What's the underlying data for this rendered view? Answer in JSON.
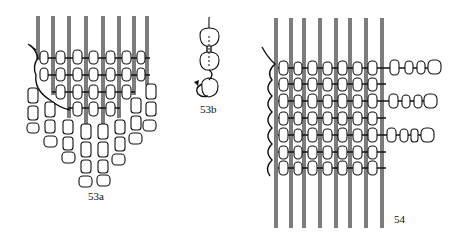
{
  "figures": [
    {
      "id": "53a",
      "label": "53a",
      "description": "bead loom weaving with dangling fringe strands"
    },
    {
      "id": "53b",
      "label": "53b",
      "description": "detail of thread looping through end bead"
    },
    {
      "id": "54",
      "label": "54",
      "description": "bead loom weaving with side fringe strands"
    }
  ],
  "colors": {
    "ink": "#111111",
    "paper": "#ffffff"
  }
}
